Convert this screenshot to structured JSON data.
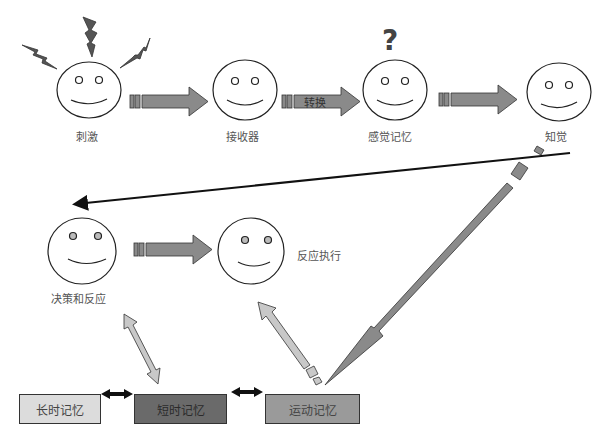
{
  "nodes": {
    "stimulus": {
      "label": "刺激",
      "icon": "lightning-bolt-icon"
    },
    "receptor": {
      "label": "接收器"
    },
    "sensory_memory": {
      "label": "感觉记忆",
      "icon": "question-mark-icon"
    },
    "perception": {
      "label": "知觉"
    },
    "decision": {
      "label": "决策和反应"
    },
    "response_execution": {
      "label": "反应执行"
    }
  },
  "arrows": {
    "transform_label": "转换"
  },
  "memory_boxes": [
    {
      "label": "长时记忆",
      "color": "#dcdcdc"
    },
    {
      "label": "短时记忆",
      "color": "#6a6a6a"
    },
    {
      "label": "运动记忆",
      "color": "#9a9a9a"
    }
  ],
  "colors": {
    "arrow_fill": "#8a8a8a",
    "light_arrow_fill": "#c8c8c8",
    "stroke": "#333333"
  }
}
